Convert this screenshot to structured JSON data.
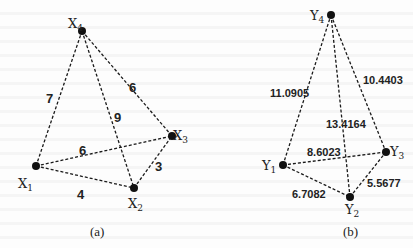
{
  "panels": [
    {
      "id": "a",
      "caption": "(a)",
      "caption_pos": [
        90,
        236
      ],
      "weight_font": 13,
      "nodes": [
        {
          "id": "X1",
          "label": "X",
          "sub": "1",
          "x": 36,
          "y": 166,
          "lx": 18,
          "ly": 188
        },
        {
          "id": "X2",
          "label": "X",
          "sub": "2",
          "x": 134,
          "y": 188,
          "lx": 128,
          "ly": 208
        },
        {
          "id": "X3",
          "label": "X",
          "sub": "3",
          "x": 172,
          "y": 136,
          "lx": 173,
          "ly": 140
        },
        {
          "id": "X4",
          "label": "X",
          "sub": "4",
          "x": 82,
          "y": 31,
          "lx": 68,
          "ly": 28
        }
      ],
      "edges": [
        {
          "from": "X1",
          "to": "X4",
          "weight": "7",
          "lx": 46,
          "ly": 103
        },
        {
          "from": "X4",
          "to": "X3",
          "weight": "6",
          "lx": 129,
          "ly": 92
        },
        {
          "from": "X4",
          "to": "X2",
          "weight": "9",
          "lx": 114,
          "ly": 122
        },
        {
          "from": "X1",
          "to": "X3",
          "weight": "6",
          "lx": 79,
          "ly": 155
        },
        {
          "from": "X2",
          "to": "X3",
          "weight": "3",
          "lx": 155,
          "ly": 171
        },
        {
          "from": "X1",
          "to": "X2",
          "weight": "4",
          "lx": 77,
          "ly": 199
        }
      ]
    },
    {
      "id": "b",
      "caption": "(b)",
      "caption_pos": [
        343,
        236
      ],
      "weight_font": 11,
      "nodes": [
        {
          "id": "Y1",
          "label": "Y",
          "sub": "1",
          "x": 283,
          "y": 165,
          "lx": 262,
          "ly": 170
        },
        {
          "id": "Y2",
          "label": "Y",
          "sub": "2",
          "x": 350,
          "y": 197,
          "lx": 345,
          "ly": 214
        },
        {
          "id": "Y3",
          "label": "Y",
          "sub": "3",
          "x": 386,
          "y": 152,
          "lx": 390,
          "ly": 156
        },
        {
          "id": "Y4",
          "label": "Y",
          "sub": "4",
          "x": 331,
          "y": 15,
          "lx": 310,
          "ly": 20
        }
      ],
      "edges": [
        {
          "from": "Y1",
          "to": "Y4",
          "weight": "11.0905",
          "lx": 270,
          "ly": 97
        },
        {
          "from": "Y4",
          "to": "Y3",
          "weight": "10.4403",
          "lx": 363,
          "ly": 84
        },
        {
          "from": "Y4",
          "to": "Y2",
          "weight": "13.4164",
          "lx": 326,
          "ly": 128
        },
        {
          "from": "Y1",
          "to": "Y3",
          "weight": "8.6023",
          "lx": 307,
          "ly": 156
        },
        {
          "from": "Y2",
          "to": "Y3",
          "weight": "5.5677",
          "lx": 367,
          "ly": 187
        },
        {
          "from": "Y1",
          "to": "Y2",
          "weight": "6.7082",
          "lx": 292,
          "ly": 198
        }
      ]
    }
  ]
}
